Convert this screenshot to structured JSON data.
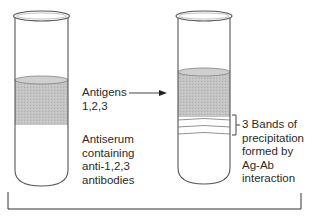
{
  "diagram": {
    "left_tube": {
      "name": "Test tube with antigens layered over antiserum",
      "upper_layer": "Antigens 1,2,3",
      "lower_layer": "Antiserum containing anti-1,2,3 antibodies"
    },
    "right_tube": {
      "name": "Test tube showing precipitation bands",
      "bands_count": 3
    },
    "labels": {
      "antigens": [
        "Antigens",
        "1,2,3"
      ],
      "antiserum": [
        "Antiserum",
        "containing",
        "anti-1,2,3",
        "antibodies"
      ],
      "bands": [
        "3 Bands of",
        "precipitation",
        "formed by",
        "Ag-Ab",
        "interaction"
      ]
    },
    "colors": {
      "outline": "#555555",
      "layer_fill": "#bdbdbd",
      "background": "#ffffff"
    }
  }
}
